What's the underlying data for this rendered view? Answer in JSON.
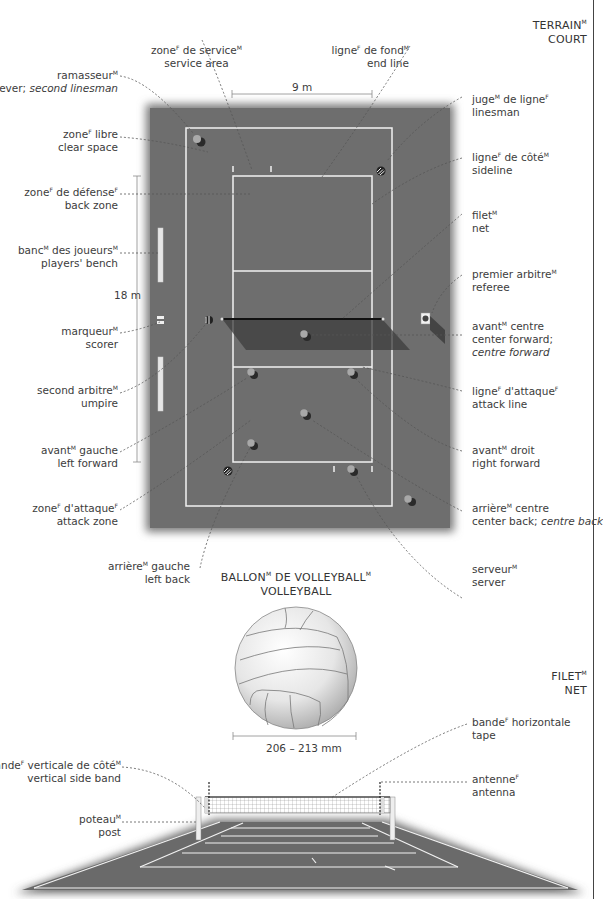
{
  "sections": {
    "court": {
      "title_fr": "TERRAIN",
      "title_fr_gender": "M",
      "title_en": "COURT"
    },
    "ball": {
      "title_fr": "BALLON",
      "title_fr_gender": "M",
      "title_fr_rest": " DE VOLLEYBALL",
      "title_fr_rest_gender": "M",
      "title_en": "VOLLEYBALL",
      "dimension": "206 – 213 mm"
    },
    "net": {
      "title_fr": "FILET",
      "title_fr_gender": "M",
      "title_en": "NET"
    }
  },
  "dimensions": {
    "width": "9 m",
    "length": "18 m"
  },
  "court_labels": {
    "service_area": {
      "fr": "zone",
      "g1": "F",
      "fr2": " de service",
      "g2": "M",
      "en": "service area"
    },
    "end_line": {
      "fr": "ligne",
      "g1": "F",
      "fr2": " de fond",
      "g2": "M",
      "en": "end line"
    },
    "retriever": {
      "fr": "ramasseur",
      "g1": "M",
      "en": "retriever; ",
      "en_it": "second linesman"
    },
    "clear_space": {
      "fr": "zone",
      "g1": "F",
      "fr2": " libre",
      "en": "clear space"
    },
    "back_zone": {
      "fr": "zone",
      "g1": "F",
      "fr2": " de défense",
      "g2": "F",
      "en": "back zone"
    },
    "players_bench": {
      "fr": "banc",
      "g1": "M",
      "fr2": " des joueurs",
      "g2": "M",
      "en": "players' bench"
    },
    "scorer": {
      "fr": "marqueur",
      "g1": "M",
      "en": "scorer"
    },
    "umpire": {
      "fr": "second arbitre",
      "g1": "M",
      "en": "umpire"
    },
    "left_forward": {
      "fr": "avant",
      "g1": "M",
      "fr2": " gauche",
      "en": "left forward"
    },
    "attack_zone": {
      "fr": "zone",
      "g1": "F",
      "fr2": " d'attaque",
      "g2": "F",
      "en": "attack zone"
    },
    "left_back": {
      "fr": "arrière",
      "g1": "M",
      "fr2": " gauche",
      "en": "left back"
    },
    "linesman": {
      "fr": "juge",
      "g1": "M",
      "fr2": " de ligne",
      "g2": "F",
      "en": "linesman"
    },
    "sideline": {
      "fr": "ligne",
      "g1": "F",
      "fr2": " de côté",
      "g2": "M",
      "en": "sideline"
    },
    "net": {
      "fr": "filet",
      "g1": "M",
      "en": "net"
    },
    "referee": {
      "fr": "premier arbitre",
      "g1": "M",
      "en": "referee"
    },
    "center_forward": {
      "fr": "avant",
      "g1": "M",
      "fr2": " centre",
      "en": "center forward;",
      "en_it": "centre forward"
    },
    "attack_line": {
      "fr": "ligne",
      "g1": "F",
      "fr2": " d'attaque",
      "g2": "F",
      "en": "attack line"
    },
    "right_forward": {
      "fr": "avant",
      "g1": "M",
      "fr2": " droit",
      "en": "right forward"
    },
    "center_back": {
      "fr": "arrière",
      "g1": "M",
      "fr2": " centre",
      "en": "center back; ",
      "en_it": "centre back"
    },
    "server": {
      "fr": "serveur",
      "g1": "M",
      "en": "server"
    }
  },
  "net_labels": {
    "vertical_side_band": {
      "fr": "bande",
      "g1": "F",
      "fr2": " verticale de côté",
      "g2": "M",
      "en": "vertical side band"
    },
    "post": {
      "fr": "poteau",
      "g1": "M",
      "en": "post"
    },
    "tape": {
      "fr": "bande",
      "g1": "F",
      "fr2": " horizontale",
      "en": "tape"
    },
    "antenna": {
      "fr": "antenne",
      "g1": "F",
      "en": "antenna"
    }
  },
  "colors": {
    "court": "#6f6f6f",
    "court_dark": "#5a5a5a",
    "line": "#f4f4f4",
    "text": "#3c3c3c",
    "leader": "#555555"
  }
}
